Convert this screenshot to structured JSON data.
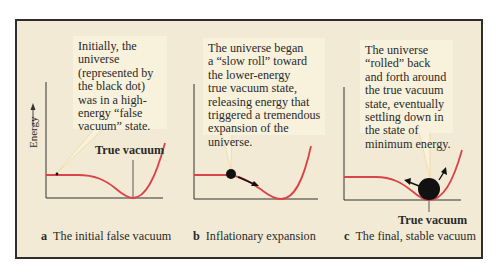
{
  "figure": {
    "y_axis_label": "Energy",
    "colors": {
      "background": "#f2ead4",
      "callout_bg": "#f8f1dc",
      "curve": "#d9444a",
      "frame": "#2e2e2e",
      "pointer": "#f3d9a0"
    },
    "panels": [
      {
        "letter": "a",
        "caption": "The initial false vacuum",
        "callout_lines": [
          "Initially, the",
          "universe",
          "(represented by",
          "the black dot)",
          "was in a high-",
          "energy “false",
          "vacuum” state."
        ],
        "marker_label": "True vacuum"
      },
      {
        "letter": "b",
        "caption": "Inflationary expansion",
        "callout_lines": [
          "The universe began",
          "a “slow roll” toward",
          "the lower-energy",
          "true vacuum state,",
          "releasing energy that",
          "triggered a tremendous",
          "expansion of the",
          "universe."
        ]
      },
      {
        "letter": "c",
        "caption": "The final, stable vacuum",
        "callout_lines": [
          "The universe",
          "“rolled” back",
          "and forth around",
          "the true vacuum",
          "state, eventually",
          "settling down in",
          "the state of",
          "minimum energy."
        ],
        "marker_label": "True vacuum"
      }
    ]
  }
}
